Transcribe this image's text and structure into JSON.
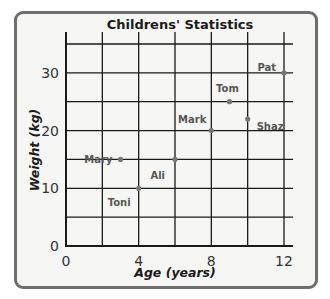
{
  "chart_data": {
    "type": "scatter",
    "title": "Childrens' Statistics",
    "xlabel": "Age (years)",
    "ylabel": "Weight (kg)",
    "xlim": [
      0,
      12
    ],
    "ylim": [
      0,
      35
    ],
    "x_ticks": [
      "0",
      "4",
      "8",
      "12"
    ],
    "y_ticks": [
      "0",
      "10",
      "20",
      "30"
    ],
    "x_grid_step": 2,
    "y_grid_step": 5,
    "grid": true,
    "legend": null,
    "points": [
      {
        "name": "Mary",
        "x": 3,
        "y": 15
      },
      {
        "name": "Ali",
        "x": 6,
        "y": 15
      },
      {
        "name": "Toni",
        "x": 4,
        "y": 10
      },
      {
        "name": "Mark",
        "x": 8,
        "y": 20
      },
      {
        "name": "Tom",
        "x": 9,
        "y": 25
      },
      {
        "name": "Shaz",
        "x": 10,
        "y": 22
      },
      {
        "name": "Pat",
        "x": 12,
        "y": 30
      }
    ]
  },
  "colors": {
    "frame_border": "#6e6e6e",
    "background": "#f6f6f4",
    "grid": "#1a1a1a",
    "points": "#777777",
    "point_labels": "#555555"
  }
}
